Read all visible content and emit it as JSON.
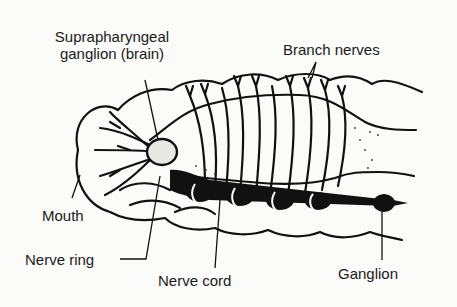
{
  "diagram": {
    "labels": {
      "brain": "Suprapharyngeal\nganglion (brain)",
      "brain_line1": "Suprapharyngeal",
      "brain_line2": "ganglion (brain)",
      "branch_nerves": "Branch nerves",
      "mouth": "Mouth",
      "nerve_ring": "Nerve ring",
      "nerve_cord": "Nerve cord",
      "ganglion": "Ganglion"
    },
    "colors": {
      "ink": "#111111",
      "background": "#fbfbf9"
    }
  }
}
